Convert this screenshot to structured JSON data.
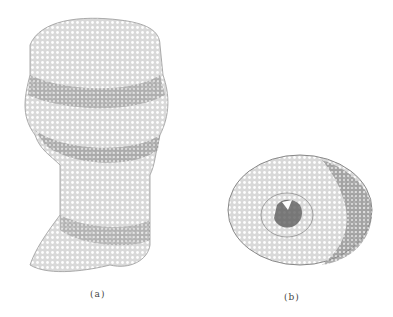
{
  "figure": {
    "panels": [
      {
        "id": "a",
        "label": "(a)",
        "description": "side view of cylindrical reticulate fossil specimen"
      },
      {
        "id": "b",
        "label": "(b)",
        "description": "top/cross-section view showing central cavity"
      }
    ],
    "colors": {
      "background": "#ffffff",
      "ink": "#555555",
      "shade": "#8a8a8a"
    }
  }
}
